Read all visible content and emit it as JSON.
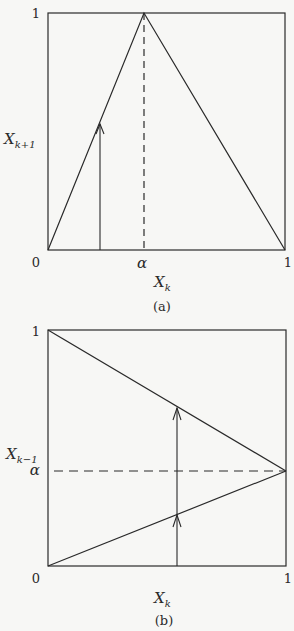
{
  "panels": [
    {
      "id": "a",
      "caption": "(a)",
      "x_axis": {
        "label_main": "X",
        "label_sub": "k",
        "ticks": [
          "0",
          "α",
          "1"
        ]
      },
      "y_axis": {
        "label_main": "X",
        "label_sub": "k+1",
        "ticks": [
          "0",
          "1"
        ]
      },
      "description": "Tent map: line rises from (0,0) to peak (α,1), then falls to (1,0). Dashed vertical line at x=α. Upward arrow from x-axis to the rising branch."
    },
    {
      "id": "b",
      "caption": "(b)",
      "x_axis": {
        "label_main": "X",
        "label_sub": "k",
        "ticks": [
          "0",
          "1"
        ]
      },
      "y_axis": {
        "label_main": "X",
        "label_sub": "k−1",
        "ticks": [
          "0",
          "α",
          "1"
        ]
      },
      "description": "Inverse map: two lines from (0,1) and (0,0) converging at (1,α). Dashed horizontal line at y=α. Vertical line with arrows pointing up to each branch."
    }
  ],
  "colors": {
    "line": "#2a2a2a",
    "background": "#f7f7f5"
  }
}
